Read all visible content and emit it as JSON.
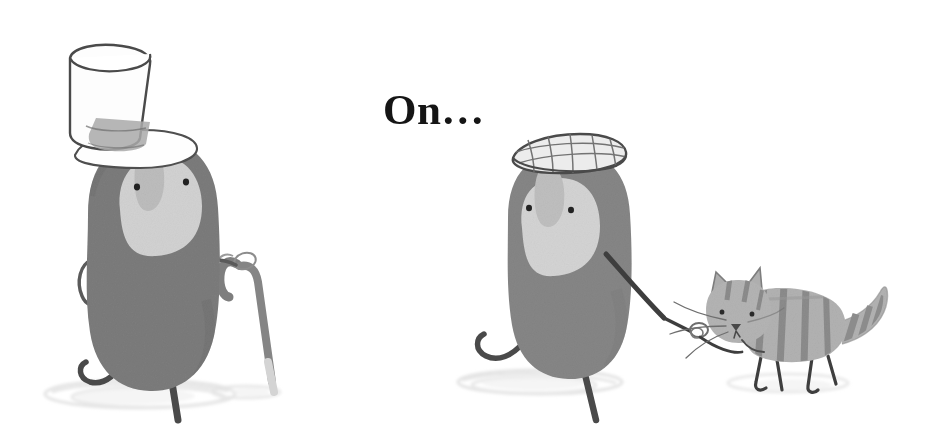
{
  "page": {
    "background_color": "#ffffff",
    "width": 941,
    "height": 433,
    "medium": "children's book watercolour illustration"
  },
  "caption": {
    "text": "On…",
    "color": "#151515",
    "font_style": "bold serif",
    "font_size_px": 43,
    "position": "top-center"
  },
  "palette": {
    "background": "#ffffff",
    "body_grey_dark": "#7c7c7c",
    "body_grey": "#868686",
    "face_patch": "#d4d4d4",
    "face_patch_mid": "#c3c3c3",
    "cat_body": "#b2b2b2",
    "cat_stripe": "#8d8d8d",
    "ink_line": "#3a3a3a",
    "ink_line_soft": "#5e5e5e",
    "hat_white": "#fdfdfd",
    "hat_band": "#a8a8a8",
    "cane_grey": "#808080",
    "cane_tip": "#d9d9d9",
    "shadow": "#dedede",
    "eye": "#2b2b2b"
  },
  "figures": [
    {
      "id": "gentleman-figure",
      "name": "grey blob character with top hat and cane",
      "side": "left",
      "body_color": "#7c7c7c",
      "face_patch_color": "#d4d4d4",
      "eyes": 2,
      "pose": "walking right, one leg lifted",
      "accessories": [
        {
          "id": "top-hat",
          "label": "white top hat",
          "color": "#fdfdfd",
          "band_color": "#a8a8a8"
        },
        {
          "id": "walking-cane",
          "label": "walking cane",
          "color": "#808080",
          "tip_color": "#d9d9d9"
        }
      ],
      "shadow": {
        "color": "#dedede",
        "shape": "sketchy ellipse"
      }
    },
    {
      "id": "cap-figure",
      "name": "grey blob character with flat cap walking a cat",
      "side": "right",
      "body_color": "#868686",
      "face_patch_color": "#d4d4d4",
      "eyes": 2,
      "pose": "walking right, arm extended holding leash",
      "accessories": [
        {
          "id": "flat-cap",
          "label": "checked flat cap",
          "color": "#e8e8e8",
          "pattern": "cross-hatch grid"
        },
        {
          "id": "leash",
          "label": "cat leash with loop handle",
          "color": "#3a3a3a"
        }
      ],
      "shadow": {
        "color": "#dedede",
        "shape": "sketchy ellipse"
      }
    },
    {
      "id": "cat",
      "name": "striped tabby cat on a leash",
      "side": "right",
      "body_color": "#b2b2b2",
      "stripe_color": "#8d8d8d",
      "features": [
        "pointed ears",
        "whiskers",
        "triangular nose",
        "long striped upright tail",
        "four thin legs"
      ],
      "shadow": {
        "color": "#e2e2e2",
        "shape": "sketchy ellipse"
      }
    }
  ]
}
